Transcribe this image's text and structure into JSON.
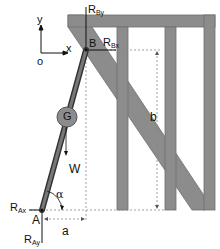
{
  "diagram": {
    "type": "statics free-body diagram",
    "colors": {
      "frame_fill": "#8c8c8c",
      "frame_stroke": "#6e6e6e",
      "rod_fill": "#5a5a5a",
      "centroid_fill": "#8c8c8c",
      "line": "#111111",
      "dashed": "#888888"
    },
    "axes": {
      "y": "y",
      "x": "x",
      "origin": "o"
    },
    "points": {
      "A": "A",
      "B": "B",
      "G": "G"
    },
    "forces": {
      "RBy": {
        "main": "R",
        "sub": "By"
      },
      "RBx": {
        "main": "R",
        "sub": "Bx"
      },
      "RAx": {
        "main": "R",
        "sub": "Ax"
      },
      "RAy": {
        "main": "R",
        "sub": "Ay"
      },
      "W": "W"
    },
    "angle": "α",
    "dimensions": {
      "a": "a",
      "b": "b"
    }
  }
}
